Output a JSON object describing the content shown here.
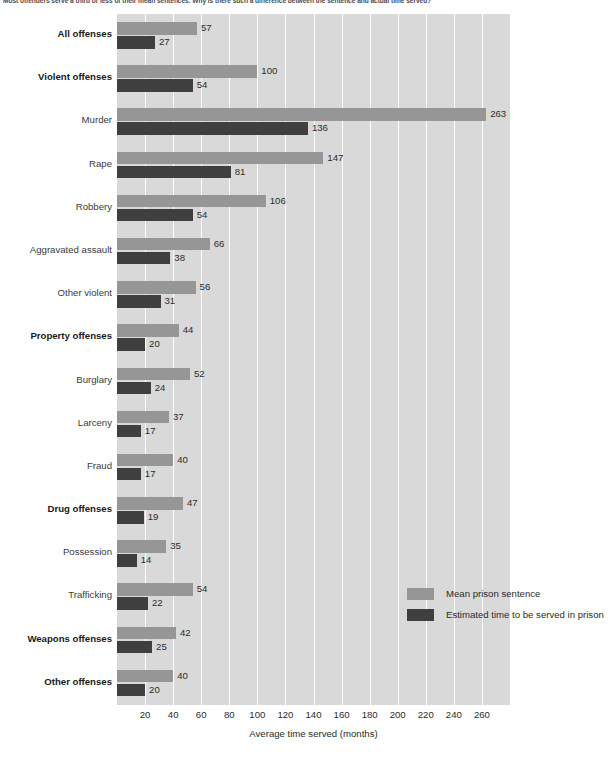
{
  "caption": "Most offenders serve a third or less of their mean sentences. Why is there such a difference between the sentence and actual time served?",
  "legend": {
    "mean_label": "Mean prison sentence",
    "served_label": "Estimated time to be served in prison",
    "mean_color": "#969696",
    "served_color": "#3f3f3f",
    "position": "inside-right"
  },
  "colors": {
    "plot_background": "#d9d9d9",
    "gridline": "#ffffff",
    "mean_bar": "#969696",
    "served_bar": "#3f3f3f",
    "text": "#2b2b2b"
  },
  "chart_data": {
    "type": "bar",
    "title": "",
    "subtitle": "",
    "orientation": "horizontal",
    "xlabel": "Average time served (months)",
    "ylabel": "",
    "xlim": [
      0,
      280
    ],
    "xticks": [
      20,
      40,
      60,
      80,
      100,
      120,
      140,
      160,
      180,
      200,
      220,
      240,
      260
    ],
    "grid": true,
    "grid_axis": "x",
    "legend_position": "inside-right",
    "categories": [
      "All offenses",
      "Violent offenses",
      "Murder",
      "Rape",
      "Robbery",
      "Aggravated assault",
      "Other violent",
      "Property offenses",
      "Burglary",
      "Larceny",
      "Fraud",
      "Drug offenses",
      "Possession",
      "Trafficking",
      "Weapons offenses",
      "Other offenses"
    ],
    "category_emphasis": [
      true,
      true,
      false,
      false,
      false,
      false,
      false,
      true,
      false,
      false,
      false,
      true,
      false,
      false,
      true,
      true
    ],
    "series": [
      {
        "name": "Mean prison sentence",
        "color": "#969696",
        "values": [
          57,
          100,
          263,
          147,
          106,
          66,
          56,
          44,
          52,
          37,
          40,
          47,
          35,
          54,
          42,
          40
        ]
      },
      {
        "name": "Estimated time to be served in prison",
        "color": "#3f3f3f",
        "values": [
          27,
          54,
          136,
          81,
          54,
          38,
          31,
          20,
          24,
          17,
          17,
          19,
          14,
          22,
          25,
          20
        ]
      }
    ]
  }
}
